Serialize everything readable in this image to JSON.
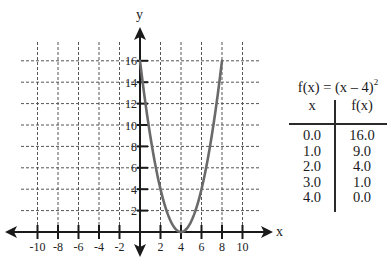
{
  "chart_data": {
    "type": "line",
    "xlabel": "x",
    "ylabel": "y",
    "xlim": [
      -12,
      12
    ],
    "ylim": [
      -2,
      18
    ],
    "grid": true,
    "x_ticks": [
      -10,
      -8,
      -6,
      -4,
      -2,
      2,
      4,
      6,
      8,
      10
    ],
    "y_ticks": [
      2,
      4,
      6,
      8,
      10,
      12,
      14,
      16
    ],
    "series": [
      {
        "name": "f(x) = (x – 4)²",
        "function": "(x-4)^2",
        "x": [
          0,
          1,
          2,
          3,
          4,
          5,
          6,
          7,
          8
        ],
        "y": [
          16,
          9,
          4,
          1,
          0,
          1,
          4,
          9,
          16
        ],
        "color": "#6a6a6a"
      }
    ]
  },
  "graph": {
    "x_axis_label": "x",
    "y_axis_label": "y",
    "x_tick_labels": [
      "-10",
      "-8",
      "-6",
      "-4",
      "-2",
      "2",
      "4",
      "6",
      "8",
      "10"
    ],
    "y_tick_labels": [
      "2",
      "4",
      "6",
      "8",
      "10",
      "12",
      "14",
      "16"
    ]
  },
  "table": {
    "title_main": "f(x) = (x – 4)",
    "title_exp": "2",
    "headers": {
      "x": "x",
      "fx": "f(x)"
    },
    "rows": [
      {
        "x": "0.0",
        "fx": "16.0"
      },
      {
        "x": "1.0",
        "fx": "9.0"
      },
      {
        "x": "2.0",
        "fx": "4.0"
      },
      {
        "x": "3.0",
        "fx": "1.0"
      },
      {
        "x": "4.0",
        "fx": "0.0"
      }
    ]
  },
  "colors": {
    "axis": "#1a1a1a",
    "grid": "#555555",
    "curve": "#6a6a6a"
  }
}
